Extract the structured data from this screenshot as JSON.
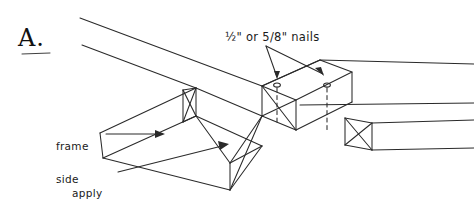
{
  "figure": {
    "letter": "A.",
    "background_color": "#ffffff",
    "ink_color": "#2a2a2a",
    "width": 474,
    "height": 215,
    "style": "hand-drawn line art / technical woodworking illustration"
  },
  "annotations": {
    "nails": {
      "text": "½\" or 5/8\" nails",
      "leader": "two arrows pointing down to two nail head markers on top face"
    },
    "frame_side": {
      "line1": "frame",
      "line2": "side",
      "text": "frame side",
      "leader": "horizontal arrow pointing right at the upper board"
    },
    "apply_glue": {
      "line1": "apply",
      "line2": "glue",
      "text": "apply glue",
      "leader": "line running up-right to an arrow on the lower board top face"
    }
  },
  "parts": {
    "upper_board": "long board running from upper-left to right edge",
    "lower_board": "long board running from left edge to center, lapping beneath",
    "right_board": "board extending to the right edge of the frame",
    "nail_markers": [
      {
        "name": "nail-1",
        "note": "small oval nail head with dashed shank"
      },
      {
        "name": "nail-2",
        "note": "small oval nail head with dashed shank"
      }
    ],
    "end_faces": "board ends drawn with X cross hatching to indicate end grain"
  }
}
